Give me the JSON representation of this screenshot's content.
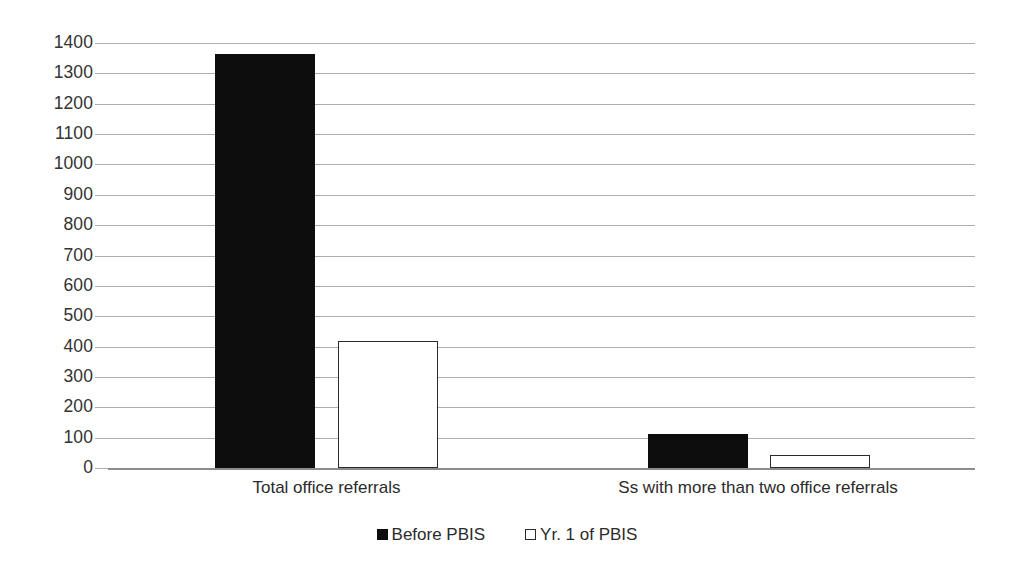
{
  "chart_data": {
    "type": "bar",
    "title": "",
    "subtitle": "",
    "xlabel": "",
    "ylabel": "",
    "categories": [
      "Total office referrals",
      "Ss with more than two office referrals"
    ],
    "series": [
      {
        "name": "Before PBIS",
        "values": [
          1364,
          113
        ],
        "color": "#0d0d0d",
        "fill": "solid"
      },
      {
        "name": "Yr. 1 of PBIS",
        "values": [
          420,
          43
        ],
        "color": "#ffffff",
        "fill": "hollow"
      }
    ],
    "ylim": [
      0,
      1400
    ],
    "ytick_step": 100,
    "yticks": [
      "0",
      "100",
      "200",
      "300",
      "400",
      "500",
      "600",
      "700",
      "800",
      "900",
      "1000",
      "1100",
      "1200",
      "1300",
      "1400"
    ],
    "grid": true,
    "grid_axis": "y",
    "legend_position": "bottom",
    "legend_entries": [
      "Before PBIS",
      "Yr. 1 of PBIS"
    ],
    "annotations": []
  },
  "colors": {
    "background": "#ffffff",
    "gridline": "#adadad",
    "axis": "#8c8c8c",
    "series_before": "#0d0d0d",
    "series_yr1": "#ffffff",
    "text": "#2b2b2b"
  }
}
